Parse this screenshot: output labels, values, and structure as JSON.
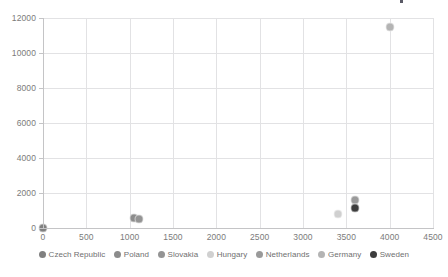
{
  "chart_data": {
    "type": "scatter",
    "title": "",
    "xlabel": "",
    "ylabel": "",
    "xlim": [
      0,
      4500
    ],
    "ylim": [
      0,
      12000
    ],
    "xticks": [
      0,
      500,
      1000,
      1500,
      2000,
      2500,
      3000,
      3500,
      4000,
      4500
    ],
    "yticks": [
      0,
      2000,
      4000,
      6000,
      8000,
      10000,
      12000
    ],
    "grid": true,
    "legend_position": "bottom",
    "series": [
      {
        "name": "Czech Republic",
        "color": "#808080",
        "x": 0,
        "y": 0
      },
      {
        "name": "Poland",
        "color": "#8c8c8c",
        "x": 1050,
        "y": 600
      },
      {
        "name": "Slovakia",
        "color": "#949494",
        "x": 1110,
        "y": 520
      },
      {
        "name": "Hungary",
        "color": "#d0d0d0",
        "x": 3400,
        "y": 780
      },
      {
        "name": "Netherlands",
        "color": "#9a9a9a",
        "x": 3600,
        "y": 1600
      },
      {
        "name": "Germany",
        "color": "#b4b4b4",
        "x": 4000,
        "y": 11500
      },
      {
        "name": "Sweden",
        "color": "#3d3d3d",
        "x": 3600,
        "y": 1150
      }
    ]
  },
  "axes": {
    "x_tick_labels": [
      "0",
      "500",
      "1000",
      "1500",
      "2000",
      "2500",
      "3000",
      "3500",
      "4000",
      "4500"
    ],
    "y_tick_labels": [
      "0",
      "2000",
      "4000",
      "6000",
      "8000",
      "10000",
      "12000"
    ]
  },
  "legend": {
    "items": [
      {
        "label": "Czech Republic",
        "color": "#808080"
      },
      {
        "label": "Poland",
        "color": "#8c8c8c"
      },
      {
        "label": "Slovakia",
        "color": "#949494"
      },
      {
        "label": "Hungary",
        "color": "#d0d0d0"
      },
      {
        "label": "Netherlands",
        "color": "#9a9a9a"
      },
      {
        "label": "Germany",
        "color": "#b4b4b4"
      },
      {
        "label": "Sweden",
        "color": "#3d3d3d"
      }
    ]
  },
  "style": {
    "grid_color": "#e2e2e4",
    "axis_color": "#c4c4c6",
    "tick_text_color": "#7b7b7b",
    "legend_text_color": "#6f6f6f",
    "background": "#ffffff"
  }
}
